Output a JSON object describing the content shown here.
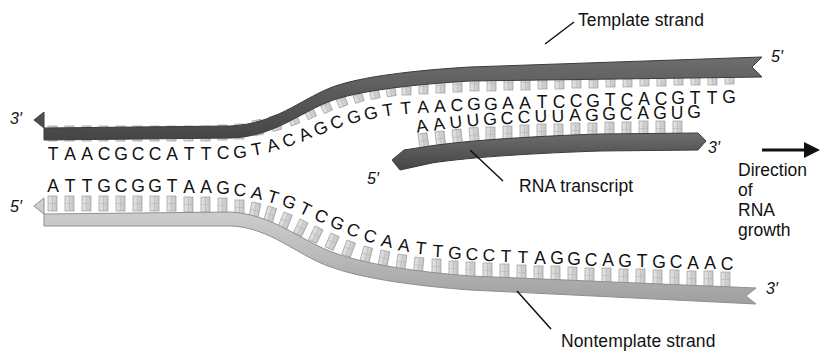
{
  "figure": {
    "colors": {
      "template_strand": "#5a5a5a",
      "nontemplate_strand": "#b8b8b8",
      "rna_strand": "#5a5a5a",
      "base_rung": "#d8d8d8",
      "background": "#ffffff",
      "text": "#111111"
    }
  },
  "labels": {
    "template_strand": "Template strand",
    "rna_transcript": "RNA transcript",
    "nontemplate_strand": "Nontemplate strand",
    "direction_line1": "Direction of",
    "direction_line2": "RNA growth"
  },
  "end_labels": {
    "template_left": "3′",
    "template_right": "5′",
    "nontemplate_left": "5′",
    "nontemplate_right": "3′",
    "rna_left": "5′",
    "rna_right": "3′"
  },
  "sequences": {
    "template": {
      "name": "Template strand",
      "polarity_left": "3′",
      "polarity_right": "5′",
      "bases": "TAACGCCATTCGTACAGCGGTTAACGGAATCCGTCACGTTG",
      "flat_left_segment": "TAACGCCATTCG",
      "curved_segment": "TACAGCGGT",
      "flat_right_segment": "TAACGGAATCCGTCACGTTG"
    },
    "rna": {
      "name": "RNA transcript",
      "polarity_left": "5′",
      "polarity_right": "3′",
      "bases": "AAUUGCCUUAGGCAGUG"
    },
    "nontemplate": {
      "name": "Nontemplate strand",
      "polarity_left": "5′",
      "polarity_right": "3′",
      "bases": "ATTGCGGTAAGCATGTCGCCAATTGCCTTAGGCAGTGCAAC",
      "flat_left_segment": "ATTGCGGTAAGC",
      "curved_segment": "ATGTCGCCA",
      "flat_right_segment": "ATTGCCTTAGGCAGTGCAAC"
    }
  },
  "arrow": {
    "name": "direction-arrow",
    "points": "right"
  }
}
